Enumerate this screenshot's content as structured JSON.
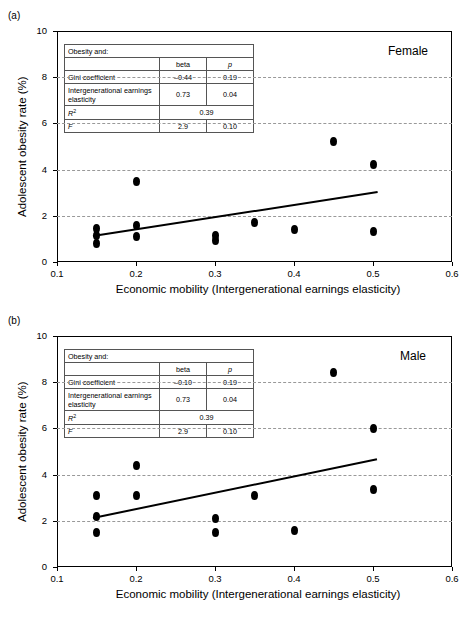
{
  "figure": {
    "panels": [
      {
        "key": "a",
        "panel_label": "(a)",
        "group_label": "Female",
        "ylabel": "Adolescent obesity rate (%)",
        "xlabel": "Economic mobility (Intergenerational earnings elasticity)",
        "yticks": [
          "0",
          "2",
          "4",
          "6",
          "8",
          "10"
        ],
        "xticks": [
          "0.1",
          "0.2",
          "0.3",
          "0.4",
          "0.5",
          "0.6"
        ],
        "table": {
          "title": "Obesity and:",
          "col_beta": "beta",
          "col_p": "p",
          "rows": [
            {
              "label": "Gini coefficient",
              "beta": "–0.44",
              "p": "0.19"
            },
            {
              "label": "Intergenerational earnings elasticity",
              "beta": "0.73",
              "p": "0.04"
            }
          ],
          "r2_label": "R",
          "r2_sup": "2",
          "r2_value": "0.39",
          "f_label": "F",
          "f_beta": "2.9",
          "f_p": "0.10"
        }
      },
      {
        "key": "b",
        "panel_label": "(b)",
        "group_label": "Male",
        "ylabel": "Adolescent obesity rate (%)",
        "xlabel": "Economic mobility (Intergenerational earnings elasticity)",
        "yticks": [
          "0",
          "2",
          "4",
          "6",
          "8",
          "10"
        ],
        "xticks": [
          "0.1",
          "0.2",
          "0.3",
          "0.4",
          "0.5",
          "0.6"
        ],
        "table": {
          "title": "Obesity and:",
          "col_beta": "beta",
          "col_p": "p",
          "rows": [
            {
              "label": "Gini coefficient",
              "beta": "–0.10",
              "p": "0.19"
            },
            {
              "label": "Intergenerational earnings elasticity",
              "beta": "0.73",
              "p": "0.04"
            }
          ],
          "r2_label": "R",
          "r2_sup": "2",
          "r2_value": "0.39",
          "f_label": "F",
          "f_beta": "2.9",
          "f_p": "0.10"
        }
      }
    ]
  },
  "chart_data": [
    {
      "type": "scatter",
      "panel": "a",
      "title": "Female",
      "xlabel": "Economic mobility (Intergenerational earnings elasticity)",
      "ylabel": "Adolescent obesity rate (%)",
      "xlim": [
        0.1,
        0.6
      ],
      "ylim": [
        0,
        10
      ],
      "xticks": [
        0.1,
        0.2,
        0.3,
        0.4,
        0.5,
        0.6
      ],
      "yticks": [
        0,
        2,
        4,
        6,
        8,
        10
      ],
      "grid": "horizontal-dashed at 2,4,6,8",
      "legend": "none",
      "points": [
        {
          "x": 0.15,
          "y": 1.45
        },
        {
          "x": 0.15,
          "y": 1.15
        },
        {
          "x": 0.15,
          "y": 0.8
        },
        {
          "x": 0.2,
          "y": 3.5
        },
        {
          "x": 0.2,
          "y": 1.6
        },
        {
          "x": 0.2,
          "y": 1.1
        },
        {
          "x": 0.3,
          "y": 1.15
        },
        {
          "x": 0.3,
          "y": 0.95
        },
        {
          "x": 0.35,
          "y": 1.7
        },
        {
          "x": 0.4,
          "y": 1.4
        },
        {
          "x": 0.45,
          "y": 5.2
        },
        {
          "x": 0.5,
          "y": 4.2
        },
        {
          "x": 0.5,
          "y": 1.3
        }
      ],
      "trendline": {
        "x0": 0.145,
        "y0": 1.15,
        "x1": 0.505,
        "y1": 3.05
      },
      "stats": {
        "gini_beta": -0.44,
        "gini_p": 0.19,
        "iee_beta": 0.73,
        "iee_p": 0.04,
        "R2": 0.39,
        "F": 2.9,
        "F_p": 0.1
      }
    },
    {
      "type": "scatter",
      "panel": "b",
      "title": "Male",
      "xlabel": "Economic mobility (Intergenerational earnings elasticity)",
      "ylabel": "Adolescent obesity rate (%)",
      "xlim": [
        0.1,
        0.6
      ],
      "ylim": [
        0,
        10
      ],
      "xticks": [
        0.1,
        0.2,
        0.3,
        0.4,
        0.5,
        0.6
      ],
      "yticks": [
        0,
        2,
        4,
        6,
        8,
        10
      ],
      "grid": "horizontal-dashed at 2,4,6,8",
      "legend": "none",
      "points": [
        {
          "x": 0.15,
          "y": 3.1
        },
        {
          "x": 0.15,
          "y": 2.2
        },
        {
          "x": 0.15,
          "y": 1.5
        },
        {
          "x": 0.2,
          "y": 4.4
        },
        {
          "x": 0.2,
          "y": 3.1
        },
        {
          "x": 0.3,
          "y": 2.1
        },
        {
          "x": 0.3,
          "y": 1.5
        },
        {
          "x": 0.35,
          "y": 3.1
        },
        {
          "x": 0.4,
          "y": 1.6
        },
        {
          "x": 0.45,
          "y": 8.4
        },
        {
          "x": 0.5,
          "y": 6.0
        },
        {
          "x": 0.5,
          "y": 3.35
        }
      ],
      "trendline": {
        "x0": 0.145,
        "y0": 2.15,
        "x1": 0.505,
        "y1": 4.7
      },
      "stats": {
        "gini_beta": -0.1,
        "gini_p": 0.19,
        "iee_beta": 0.73,
        "iee_p": 0.04,
        "R2": 0.39,
        "F": 2.9,
        "F_p": 0.1
      }
    }
  ]
}
